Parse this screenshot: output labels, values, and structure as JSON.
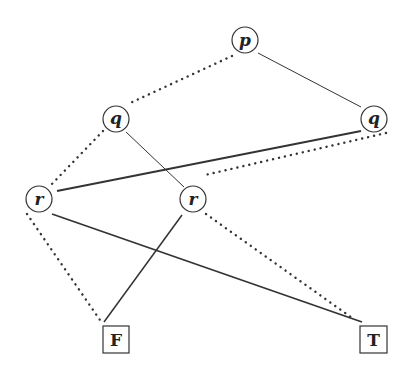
{
  "diagram": {
    "type": "binary-decision-diagram",
    "colors": {
      "stroke": "#333333",
      "text": "#222222",
      "background": "#ffffff"
    },
    "nodes": [
      {
        "id": "p",
        "label": "p",
        "kind": "decision",
        "cx": 245,
        "cy": 40,
        "r": 13
      },
      {
        "id": "q1",
        "label": "q",
        "kind": "decision",
        "cx": 116,
        "cy": 119,
        "r": 13
      },
      {
        "id": "q2",
        "label": "q",
        "kind": "decision",
        "cx": 374,
        "cy": 119,
        "r": 13
      },
      {
        "id": "r1",
        "label": "r",
        "kind": "decision",
        "cx": 39,
        "cy": 199,
        "r": 13
      },
      {
        "id": "r2",
        "label": "r",
        "kind": "decision",
        "cx": 193,
        "cy": 199,
        "r": 13
      },
      {
        "id": "F",
        "label": "F",
        "kind": "terminal",
        "x": 103,
        "y": 326,
        "w": 26,
        "h": 27
      },
      {
        "id": "T",
        "label": "T",
        "kind": "terminal",
        "x": 360,
        "y": 326,
        "w": 27,
        "h": 27
      }
    ],
    "edges": [
      {
        "from": "p",
        "to": "q1",
        "style": "dotted",
        "x1": 232,
        "y1": 56,
        "x2": 128,
        "y2": 104
      },
      {
        "from": "p",
        "to": "q2",
        "style": "solid",
        "x1": 258,
        "y1": 53,
        "x2": 361,
        "y2": 107,
        "width": 1
      },
      {
        "from": "q1",
        "to": "r1",
        "style": "dotted",
        "x1": 103,
        "y1": 131,
        "x2": 50,
        "y2": 186
      },
      {
        "from": "q1",
        "to": "r2",
        "style": "solid",
        "x1": 126,
        "y1": 132,
        "x2": 184,
        "y2": 187,
        "width": 1
      },
      {
        "from": "q2",
        "to": "r1",
        "style": "solid",
        "x1": 361,
        "y1": 131,
        "x2": 57,
        "y2": 191,
        "width": 1.8
      },
      {
        "from": "q2",
        "to": "r2",
        "style": "dotted",
        "x1": 386,
        "y1": 133,
        "x2": 205,
        "y2": 175
      },
      {
        "from": "r1",
        "to": "F",
        "style": "dotted",
        "x1": 27,
        "y1": 214,
        "x2": 100,
        "y2": 320
      },
      {
        "from": "r1",
        "to": "T",
        "style": "solid",
        "x1": 52,
        "y1": 214,
        "x2": 362,
        "y2": 322,
        "width": 1.8
      },
      {
        "from": "r2",
        "to": "F",
        "style": "solid",
        "x1": 182,
        "y1": 215,
        "x2": 104,
        "y2": 322,
        "width": 1.5
      },
      {
        "from": "r2",
        "to": "T",
        "style": "dotted",
        "x1": 206,
        "y1": 214,
        "x2": 355,
        "y2": 320
      }
    ]
  },
  "labels": {
    "p": "p",
    "q1": "q",
    "q2": "q",
    "r1": "r",
    "r2": "r",
    "F": "F",
    "T": "T"
  }
}
